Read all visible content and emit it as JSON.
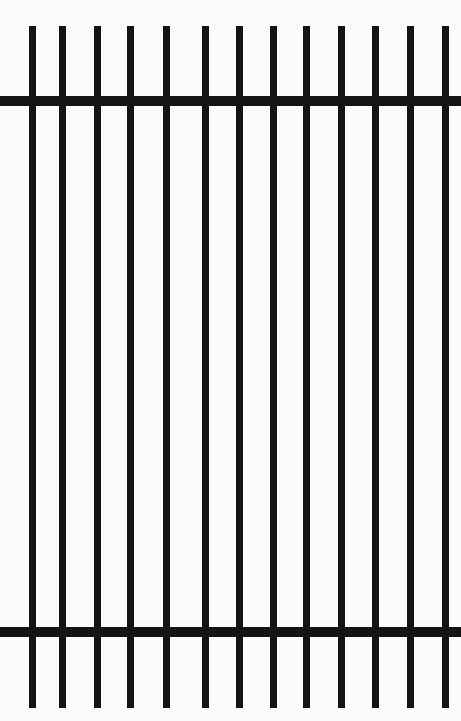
{
  "drawing": {
    "subject": "fence-panel",
    "background_color": "#fbfbfb",
    "ink_color": "#141414",
    "rails": [
      {
        "name": "top-rail",
        "top": 96,
        "left": 0,
        "width": 461,
        "height": 10
      },
      {
        "name": "bottom-rail",
        "top": 627,
        "left": 0,
        "width": 461,
        "height": 10
      }
    ],
    "pickets": {
      "top": 26,
      "bottom": 708,
      "width": 7,
      "count": 13,
      "centers_x": [
        32,
        62,
        97,
        130,
        166,
        205,
        239,
        273,
        306,
        341,
        375,
        410,
        445
      ]
    }
  }
}
